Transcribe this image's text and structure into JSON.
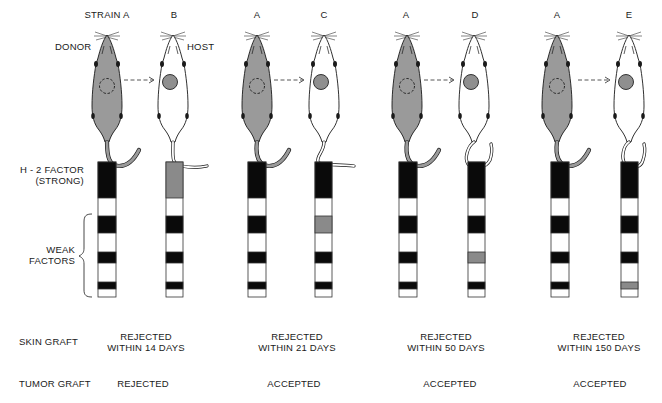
{
  "colors": {
    "donor_fill": "#9a9a9a",
    "tumor_fill": "#8f8f8f",
    "host_fill": "#ffffff",
    "strong_black": "#0a0a0a",
    "mismatch_gray": "#8a8a8a"
  },
  "labels": {
    "donor": "DONOR",
    "host": "HOST",
    "h2_line1": "H - 2 FACTOR",
    "h2_line2": "(STRONG)",
    "weak_line1": "WEAK",
    "weak_line2": "FACTORS",
    "skin_graft": "SKIN GRAFT",
    "tumor_graft": "TUMOR GRAFT"
  },
  "pairs": [
    {
      "donor_strain": "STRAIN A",
      "host_strain": "B",
      "mismatch": "strong",
      "skin_line1": "REJECTED",
      "skin_line2": "WITHIN 14 DAYS",
      "tumor": "REJECTED"
    },
    {
      "donor_strain": "A",
      "host_strain": "C",
      "mismatch": "weak1",
      "skin_line1": "REJECTED",
      "skin_line2": "WITHIN 21 DAYS",
      "tumor": "ACCEPTED"
    },
    {
      "donor_strain": "A",
      "host_strain": "D",
      "mismatch": "weak2",
      "skin_line1": "REJECTED",
      "skin_line2": "WITHIN 50 DAYS",
      "tumor": "ACCEPTED"
    },
    {
      "donor_strain": "A",
      "host_strain": "E",
      "mismatch": "weak3",
      "skin_line1": "REJECTED",
      "skin_line2": "WITHIN 150 DAYS",
      "tumor": "ACCEPTED"
    }
  ]
}
